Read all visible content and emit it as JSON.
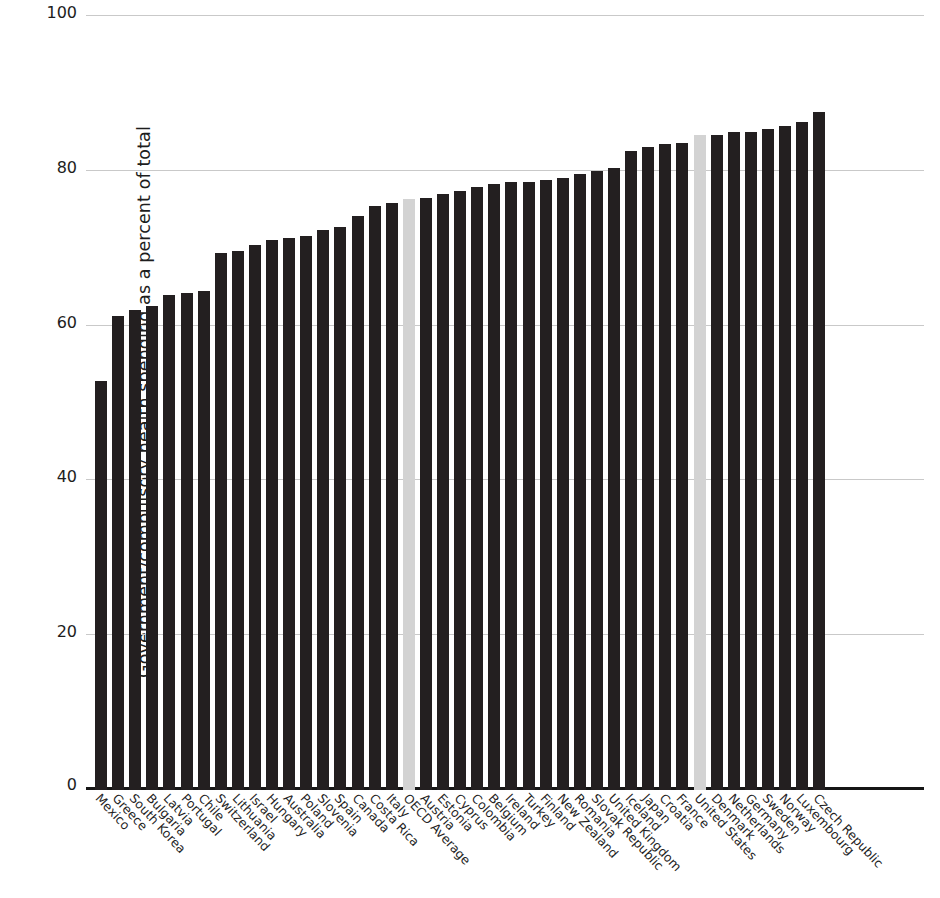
{
  "chart_data": {
    "type": "bar",
    "title": "",
    "xlabel": "",
    "ylabel": "Government/compulsory health spending as a percent of total",
    "ylim": [
      0,
      100
    ],
    "yticks": [
      "0",
      "20",
      "40",
      "60",
      "80",
      "100"
    ],
    "ytick_values": [
      0,
      20,
      40,
      60,
      80,
      100
    ],
    "grid": "horizontal",
    "legend": "none",
    "bar_color": "#231f20",
    "highlight_color": "#d3d3d3",
    "highlighted_categories": [
      "OECD Average",
      "United States"
    ],
    "categories": [
      "Mexico",
      "Greece",
      "South Korea",
      "Bulgaria",
      "Latvia",
      "Portugal",
      "Chile",
      "Switzerland",
      "Lithuania",
      "Israel",
      "Hungary",
      "Australia",
      "Poland",
      "Slovenia",
      "Spain",
      "Canada",
      "Costa Rica",
      "Italy",
      "OECD Average",
      "Austria",
      "Estonia",
      "Cyprus",
      "Colombia",
      "Belgium",
      "Ireland",
      "Turkey",
      "Finland",
      "New Zealand",
      "Romania",
      "Slovak Republic",
      "United Kingdom",
      "Iceland",
      "Japan",
      "Croatia",
      "France",
      "United States",
      "Denmark",
      "Netherlands",
      "Germany",
      "Sweden",
      "Norway",
      "Luxembourg",
      "Czech Republic"
    ],
    "values": [
      52.9,
      61.3,
      62.0,
      62.5,
      64.0,
      64.2,
      64.5,
      69.4,
      69.7,
      70.4,
      71.0,
      71.3,
      71.6,
      72.4,
      72.7,
      74.2,
      75.4,
      75.8,
      76.3,
      76.5,
      77.0,
      77.4,
      77.9,
      78.3,
      78.5,
      78.6,
      78.8,
      79.1,
      79.6,
      80.0,
      80.4,
      82.6,
      83.1,
      83.4,
      83.6,
      84.6,
      84.6,
      85.0,
      85.0,
      85.4,
      85.8,
      86.3,
      87.6
    ],
    "unit": "percent of total health spending",
    "n_categories": 43
  }
}
